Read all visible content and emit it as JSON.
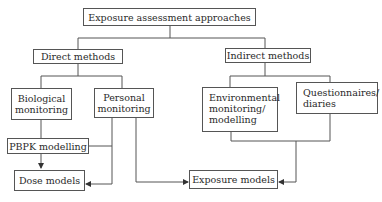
{
  "diagram": {
    "root": {
      "label": "Exposure assessment approaches"
    },
    "branches": [
      {
        "label": "Direct methods",
        "children": [
          {
            "label_lines": [
              "Biological",
              "monitoring"
            ]
          },
          {
            "label_lines": [
              "Personal",
              "monitoring"
            ]
          }
        ]
      },
      {
        "label": "Indirect methods",
        "children": [
          {
            "label_lines": [
              "Environmental",
              "monitoring/",
              "modelling"
            ]
          },
          {
            "label_lines": [
              "Questionnaires/",
              "diaries"
            ]
          }
        ]
      }
    ],
    "intermediate": {
      "label": "PBPK modelling"
    },
    "outputs": [
      {
        "label": "Dose models"
      },
      {
        "label": "Exposure models"
      }
    ],
    "edges": [
      {
        "from": "Exposure assessment approaches",
        "to": "Direct methods"
      },
      {
        "from": "Exposure assessment approaches",
        "to": "Indirect methods"
      },
      {
        "from": "Direct methods",
        "to": "Biological monitoring"
      },
      {
        "from": "Direct methods",
        "to": "Personal monitoring"
      },
      {
        "from": "Indirect methods",
        "to": "Environmental monitoring/modelling"
      },
      {
        "from": "Indirect methods",
        "to": "Questionnaires/diaries"
      },
      {
        "from": "Biological monitoring",
        "to": "PBPK modelling"
      },
      {
        "from": "PBPK modelling",
        "to": "Dose models",
        "arrow": true
      },
      {
        "from": "Personal monitoring",
        "to": "Dose models",
        "arrow": true
      },
      {
        "from": "Personal monitoring",
        "to": "Exposure models",
        "arrow": true
      },
      {
        "from": "Environmental monitoring/modelling",
        "to": "Exposure models",
        "arrow": true
      },
      {
        "from": "Questionnaires/diaries",
        "to": "Exposure models",
        "arrow": true
      }
    ]
  }
}
